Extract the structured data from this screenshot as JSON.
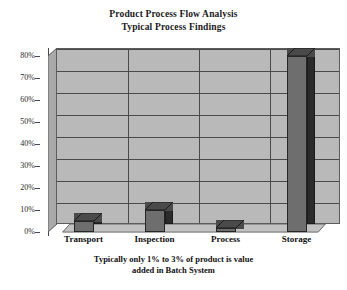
{
  "chart_data": {
    "type": "bar",
    "title": "Product Process Flow Analysis",
    "subtitle": "Typical Process Findings",
    "caption_line1": "Typically only 1% to 3% of product is value",
    "caption_line2": "added in Batch System",
    "xlabel": "",
    "ylabel": "",
    "categories": [
      "Transport",
      "Inspection",
      "Process",
      "Storage"
    ],
    "values": [
      5,
      10,
      2,
      80
    ],
    "ylim": [
      0,
      80
    ],
    "ytick_labels": [
      "80%",
      "70%",
      "60%",
      "50%",
      "40%",
      "30%",
      "20%",
      "10%",
      "0%"
    ],
    "ytick_values": [
      80,
      70,
      60,
      50,
      40,
      30,
      20,
      10,
      0
    ],
    "grid": true,
    "legend": "none",
    "style": "3d-column",
    "colors": {
      "bar_front": "#6e6e6e",
      "bar_side": "#2b2b2b",
      "bar_top": "#4a4a4a",
      "plot_background": "#b9b9b9",
      "gridline": "#4a4a4a",
      "page_background": "#ffffff",
      "text": "#111111"
    }
  }
}
